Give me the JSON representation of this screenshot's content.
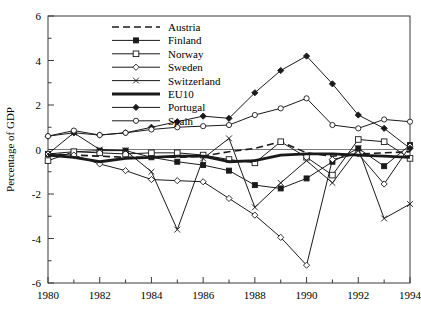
{
  "chart_data": {
    "type": "line",
    "title": "",
    "xlabel": "",
    "ylabel": "Percentage of GDP",
    "xlim": [
      1980,
      1994
    ],
    "ylim": [
      -6,
      6
    ],
    "ytick_labels": [
      "6",
      "4",
      "2",
      "0",
      "-2",
      "-4",
      "-6"
    ],
    "ytick_values": [
      6,
      4,
      2,
      0,
      -2,
      -4,
      -6
    ],
    "yminor_step": 1,
    "xtick_labels": [
      "1980",
      "1982",
      "1984",
      "1986",
      "1988",
      "1990",
      "1992",
      "1994"
    ],
    "xtick_values": [
      1980,
      1982,
      1984,
      1986,
      1988,
      1990,
      1992,
      1994
    ],
    "xminor_step": 1,
    "grid": false,
    "legend_position": "top-left-inside",
    "x": [
      1980,
      1981,
      1982,
      1983,
      1984,
      1985,
      1986,
      1987,
      1988,
      1989,
      1990,
      1991,
      1992,
      1993,
      1994
    ],
    "series": [
      {
        "name": "Austria",
        "marker": "none",
        "dash": "dashed",
        "width": 1.6,
        "values": [
          -0.2,
          -0.25,
          -0.3,
          -0.35,
          -0.35,
          -0.35,
          -0.3,
          -0.1,
          0.05,
          0.35,
          -0.15,
          -0.3,
          -0.2,
          -0.15,
          -0.1
        ]
      },
      {
        "name": "Finland",
        "marker": "filled-square",
        "dash": "solid",
        "width": 1.0,
        "values": [
          -0.2,
          -0.1,
          -0.05,
          -0.05,
          -0.35,
          -0.55,
          -0.7,
          -0.95,
          -1.6,
          -1.75,
          -1.3,
          -0.55,
          0.05,
          -0.75,
          0.2
        ]
      },
      {
        "name": "Norway",
        "marker": "open-square",
        "dash": "solid",
        "width": 1.0,
        "values": [
          -0.5,
          -0.1,
          -0.15,
          -0.2,
          -0.15,
          -0.15,
          -0.25,
          -0.45,
          -0.6,
          0.35,
          -0.35,
          -1.15,
          0.45,
          0.35,
          -0.4
        ]
      },
      {
        "name": "Sweden",
        "marker": "open-diamond",
        "dash": "solid",
        "width": 1.0,
        "values": [
          -0.2,
          -0.25,
          -0.65,
          -0.95,
          -1.35,
          -1.4,
          -1.45,
          -2.2,
          -2.95,
          -3.95,
          -5.2,
          -0.45,
          -0.2,
          -1.55,
          0.15
        ]
      },
      {
        "name": "Switzerland",
        "marker": "cross-x",
        "dash": "solid",
        "width": 1.0,
        "values": [
          -0.2,
          0.75,
          0.0,
          -0.05,
          -1.0,
          -3.6,
          -0.4,
          0.5,
          -2.6,
          -1.5,
          -0.5,
          -1.5,
          0.05,
          -3.1,
          -2.45
        ]
      },
      {
        "name": "EU10",
        "marker": "none",
        "dash": "solid",
        "width": 2.8,
        "values": [
          -0.25,
          -0.35,
          -0.55,
          -0.4,
          -0.35,
          -0.3,
          -0.3,
          -0.55,
          -0.5,
          -0.25,
          -0.2,
          -0.2,
          -0.25,
          -0.3,
          -0.35
        ]
      },
      {
        "name": "Portugal",
        "marker": "filled-diamond",
        "dash": "solid",
        "width": 1.0,
        "values": [
          0.6,
          0.75,
          0.65,
          0.75,
          1.0,
          1.25,
          1.5,
          1.4,
          2.55,
          3.55,
          4.2,
          2.95,
          1.55,
          0.95,
          0.05
        ]
      },
      {
        "name": "Spain",
        "marker": "open-circle",
        "dash": "solid",
        "width": 1.0,
        "values": [
          0.6,
          0.85,
          0.65,
          0.75,
          0.9,
          1.0,
          1.05,
          1.1,
          1.55,
          1.85,
          2.3,
          1.1,
          0.95,
          1.35,
          1.25
        ]
      }
    ]
  },
  "legend": {
    "entries": [
      {
        "label": "Austria"
      },
      {
        "label": "Finland"
      },
      {
        "label": "Norway"
      },
      {
        "label": "Sweden"
      },
      {
        "label": "Switzerland"
      },
      {
        "label": "EU10"
      },
      {
        "label": "Portugal"
      },
      {
        "label": "Spain"
      }
    ]
  },
  "axes": {
    "y_title": "Percentage of GDP"
  }
}
